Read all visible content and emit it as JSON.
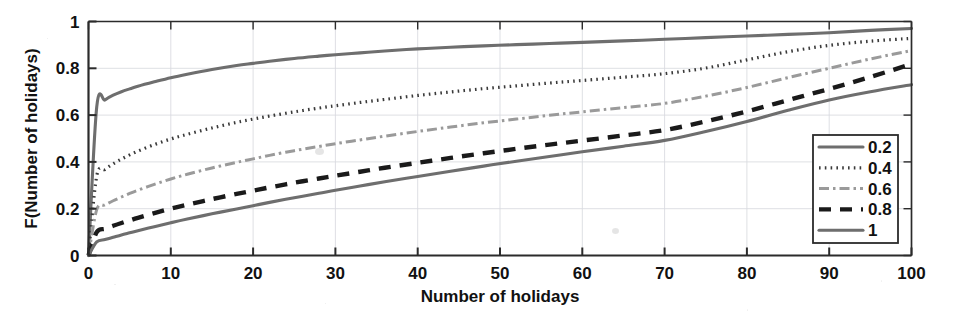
{
  "chart_data": {
    "type": "line",
    "title": "",
    "xlabel": "Number of holidays",
    "ylabel": "F(Number of holidays)",
    "xlim": [
      0,
      100
    ],
    "ylim": [
      0,
      1
    ],
    "xticks": [
      "0",
      "10",
      "20",
      "30",
      "40",
      "50",
      "60",
      "70",
      "80",
      "90",
      "100"
    ],
    "yticks": [
      "0",
      "0.2",
      "0.4",
      "0.6",
      "0.8",
      "1"
    ],
    "grid": true,
    "legend_position": "lower-right",
    "legend_title": "",
    "x": [
      0,
      1,
      2,
      3,
      4,
      5,
      6,
      8,
      10,
      12,
      15,
      18,
      20,
      22,
      25,
      28,
      30,
      33,
      36,
      40,
      44,
      48,
      52,
      56,
      60,
      65,
      70,
      75,
      80,
      85,
      90,
      95,
      100
    ],
    "series": [
      {
        "name": "0.2",
        "style": "solid",
        "color": "#6e6e6e",
        "values": [
          0.0,
          0.635,
          0.665,
          0.685,
          0.7,
          0.712,
          0.723,
          0.742,
          0.76,
          0.775,
          0.795,
          0.812,
          0.821,
          0.83,
          0.842,
          0.852,
          0.858,
          0.866,
          0.874,
          0.883,
          0.89,
          0.896,
          0.901,
          0.906,
          0.911,
          0.917,
          0.924,
          0.931,
          0.938,
          0.945,
          0.952,
          0.962,
          0.97
        ]
      },
      {
        "name": "0.4",
        "style": "dotted",
        "color": "#3a3a3a",
        "values": [
          0.0,
          0.34,
          0.368,
          0.392,
          0.412,
          0.43,
          0.446,
          0.474,
          0.498,
          0.518,
          0.545,
          0.569,
          0.583,
          0.596,
          0.614,
          0.63,
          0.64,
          0.654,
          0.667,
          0.684,
          0.699,
          0.713,
          0.725,
          0.737,
          0.748,
          0.762,
          0.777,
          0.801,
          0.836,
          0.871,
          0.898,
          0.916,
          0.928
        ]
      },
      {
        "name": "0.6",
        "style": "dashdot",
        "color": "#9a9a9a",
        "values": [
          0.0,
          0.196,
          0.216,
          0.234,
          0.25,
          0.265,
          0.279,
          0.304,
          0.327,
          0.347,
          0.374,
          0.398,
          0.413,
          0.428,
          0.448,
          0.466,
          0.478,
          0.494,
          0.51,
          0.53,
          0.549,
          0.567,
          0.583,
          0.599,
          0.614,
          0.632,
          0.65,
          0.681,
          0.718,
          0.76,
          0.8,
          0.84,
          0.876
        ]
      },
      {
        "name": "0.8",
        "style": "dashed",
        "color": "#1a1a1a",
        "values": [
          0.0,
          0.1,
          0.114,
          0.127,
          0.139,
          0.15,
          0.161,
          0.181,
          0.2,
          0.217,
          0.241,
          0.263,
          0.277,
          0.291,
          0.311,
          0.329,
          0.341,
          0.358,
          0.375,
          0.396,
          0.417,
          0.437,
          0.456,
          0.474,
          0.491,
          0.513,
          0.536,
          0.573,
          0.616,
          0.664,
          0.712,
          0.763,
          0.818
        ]
      },
      {
        "name": "1",
        "style": "solid",
        "color": "#6e6e6e",
        "values": [
          0.0,
          0.058,
          0.068,
          0.078,
          0.088,
          0.097,
          0.106,
          0.123,
          0.14,
          0.156,
          0.178,
          0.199,
          0.213,
          0.227,
          0.247,
          0.266,
          0.279,
          0.297,
          0.315,
          0.338,
          0.36,
          0.382,
          0.403,
          0.423,
          0.443,
          0.467,
          0.492,
          0.53,
          0.573,
          0.621,
          0.665,
          0.7,
          0.73
        ]
      }
    ]
  },
  "legend": {
    "entries": [
      {
        "label": "0.2"
      },
      {
        "label": "0.4"
      },
      {
        "label": "0.6"
      },
      {
        "label": "0.8"
      },
      {
        "label": "1"
      }
    ]
  }
}
